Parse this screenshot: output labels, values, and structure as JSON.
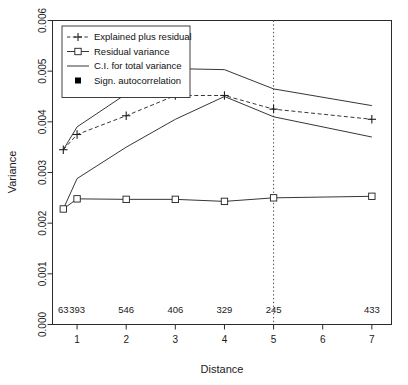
{
  "chart_data": {
    "type": "line",
    "title": "",
    "xlabel": "Distance",
    "ylabel": "Variance",
    "xlim": [
      0.5,
      7.4
    ],
    "ylim": [
      0.0,
      0.006
    ],
    "grid": false,
    "x_ticks": [
      1,
      2,
      3,
      4,
      5,
      6,
      7
    ],
    "x_tick_labels": [
      "1",
      "2",
      "3",
      "4",
      "5",
      "6",
      "7"
    ],
    "y_ticks": [
      0.0,
      0.001,
      0.002,
      0.003,
      0.004,
      0.005,
      0.006
    ],
    "y_tick_labels": [
      "0.000",
      "0.001",
      "0.002",
      "0.003",
      "0.004",
      "0.005",
      "0.006"
    ],
    "legend_position": "top-left",
    "x": [
      0.72,
      1,
      2,
      3,
      4,
      5,
      7
    ],
    "series": [
      {
        "name": "Explained plus residual",
        "style": "dashed-plus",
        "values": [
          0.00345,
          0.00375,
          0.00412,
          0.00452,
          0.00452,
          0.00425,
          0.00405
        ]
      },
      {
        "name": "Residual variance",
        "style": "solid-square",
        "values": [
          0.00228,
          0.00248,
          0.00247,
          0.00247,
          0.00243,
          0.0025,
          0.00253
        ]
      },
      {
        "name": "C.I. for total variance (upper)",
        "style": "solid-line",
        "values": [
          0.00345,
          0.0039,
          0.00455,
          0.00505,
          0.00503,
          0.00465,
          0.00432
        ]
      },
      {
        "name": "C.I. for total variance (lower)",
        "style": "solid-line",
        "values": [
          0.00228,
          0.00288,
          0.0035,
          0.00405,
          0.0045,
          0.0041,
          0.0037
        ]
      }
    ],
    "reference_line": {
      "orientation": "vertical",
      "x": 5,
      "style": "dotted"
    },
    "sample_labels": {
      "y": 0.00022,
      "x": [
        0.72,
        1,
        2,
        3,
        4,
        5,
        7
      ],
      "values": [
        "63",
        "393",
        "546",
        "406",
        "329",
        "245",
        "433"
      ]
    },
    "significant_autocorrelation_points": []
  },
  "legend": {
    "items": [
      {
        "label": "Explained plus residual",
        "marker": "plus-dashed"
      },
      {
        "label": "Residual variance",
        "marker": "square-solid"
      },
      {
        "label": "C.I. for total variance",
        "marker": "line-solid"
      },
      {
        "label": "Sign. autocorrelation",
        "marker": "filled-square"
      }
    ]
  },
  "colors": {
    "ink": "#111111",
    "axis": "#3a3a3a",
    "plot_bg": "#ffffff"
  }
}
